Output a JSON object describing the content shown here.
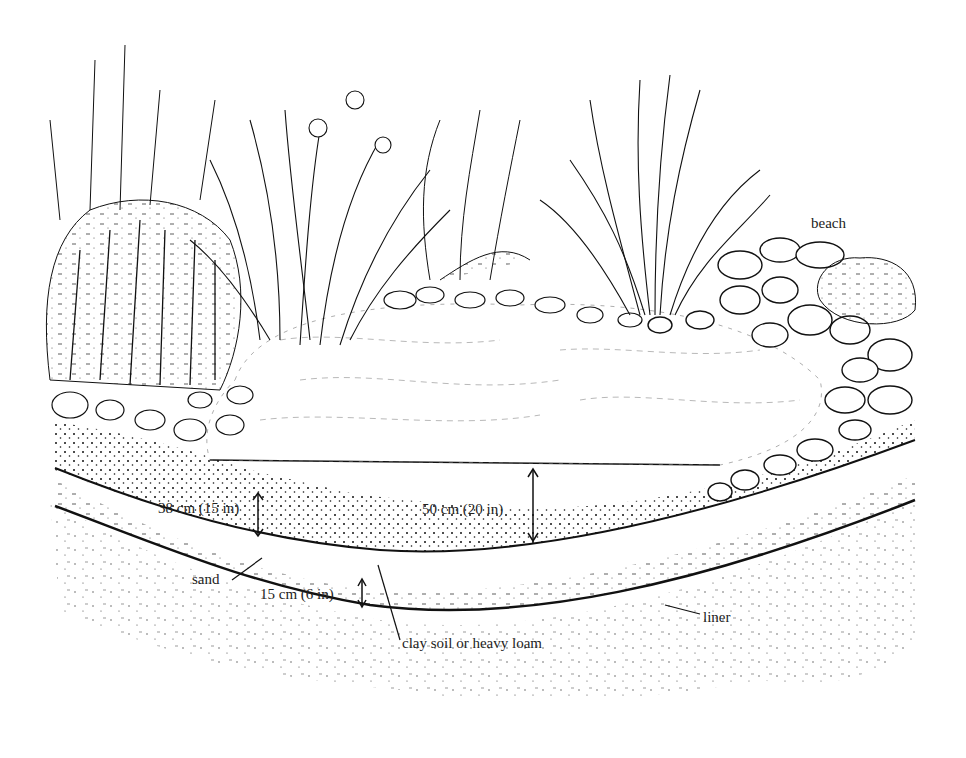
{
  "figure": {
    "labels": {
      "beach": "beach",
      "sand_depth": "38 cm (15 in)",
      "water_depth": "50 cm (20 in)",
      "sand": "sand",
      "clay_depth": "15 cm (6 in)",
      "clay": "clay soil or heavy loam",
      "liner": "liner"
    },
    "colors": {
      "ink": "#111111",
      "background": "#ffffff"
    }
  }
}
